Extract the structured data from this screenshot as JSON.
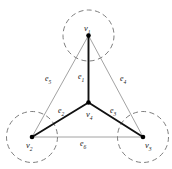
{
  "figure": {
    "background_color": "#ffffff",
    "colors": {
      "thick_edge": "#111111",
      "thin_edge": "#8a8a8a",
      "dashed_circle": "#6e6e6e",
      "vertex_dot": "#000000",
      "label_text": "#1a1a1a"
    }
  },
  "vertices": [
    {
      "id": "v1",
      "name": "v",
      "sub": "1",
      "label_x": 84,
      "label_y": 24,
      "cx": 88.5,
      "cy": 35.5,
      "r": 2.3,
      "circle_r": 25.5,
      "has_dashed_circle": true
    },
    {
      "id": "v2",
      "name": "v",
      "sub": "2",
      "label_x": 26,
      "label_y": 141,
      "cx": 32.0,
      "cy": 137.0,
      "r": 2.3,
      "circle_r": 25.5,
      "has_dashed_circle": true
    },
    {
      "id": "v3",
      "name": "v",
      "sub": "3",
      "label_x": 145,
      "label_y": 141,
      "cx": 143.0,
      "cy": 137.0,
      "r": 2.3,
      "circle_r": 25.5,
      "has_dashed_circle": true
    },
    {
      "id": "v4",
      "name": "v",
      "sub": "4",
      "label_x": 86,
      "label_y": 110,
      "cx": 88.5,
      "cy": 102.5,
      "r": 2.3,
      "circle_r": 0,
      "has_dashed_circle": false
    }
  ],
  "edges": [
    {
      "id": "e1",
      "name": "e",
      "sub": "1",
      "from": "v4",
      "to": "v1",
      "style": "thick",
      "label_x": 78,
      "label_y": 73
    },
    {
      "id": "e2",
      "name": "e",
      "sub": "2",
      "from": "v4",
      "to": "v2",
      "style": "thick",
      "label_x": 58,
      "label_y": 107
    },
    {
      "id": "e3",
      "name": "e",
      "sub": "3",
      "from": "v4",
      "to": "v3",
      "style": "thick",
      "label_x": 110,
      "label_y": 107
    },
    {
      "id": "e4",
      "name": "e",
      "sub": "4",
      "from": "v1",
      "to": "v3",
      "style": "thin",
      "label_x": 120,
      "label_y": 75
    },
    {
      "id": "e5",
      "name": "e",
      "sub": "5",
      "from": "v1",
      "to": "v2",
      "style": "thin",
      "label_x": 45,
      "label_y": 75
    },
    {
      "id": "e6",
      "name": "e",
      "sub": "6",
      "from": "v2",
      "to": "v3",
      "style": "thin",
      "label_x": 80,
      "label_y": 140
    }
  ]
}
